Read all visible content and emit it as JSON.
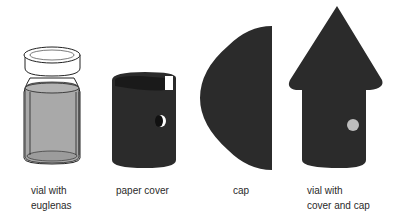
{
  "items": [
    {
      "id": "vial",
      "label": "vial with\neuglenas"
    },
    {
      "id": "paper-cover",
      "label": "paper cover"
    },
    {
      "id": "cap",
      "label": "cap"
    },
    {
      "id": "assembled",
      "label": "vial with\ncover and cap"
    }
  ],
  "colors": {
    "paper": "#2b2b2b",
    "liquid": "#a9a9a9",
    "outline": "#222222",
    "hole": "#bdbdbd"
  }
}
